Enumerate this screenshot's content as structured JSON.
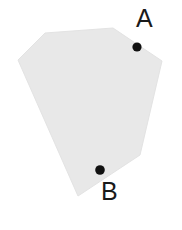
{
  "figure": {
    "type": "geometric-shape-diagram",
    "background_color": "#ffffff",
    "canvas": {
      "width": 182,
      "height": 230
    },
    "shape": {
      "name": "irregular-hexagon",
      "fill_color": "#e8e8e8",
      "stroke_color": "#e3e3e3",
      "vertices": [
        [
          45,
          33
        ],
        [
          113,
          28
        ],
        [
          162,
          61
        ],
        [
          140,
          155
        ],
        [
          78,
          196
        ],
        [
          18,
          60
        ]
      ],
      "points_path": "45,33 113,28 162,61 140,155 78,196 18,60"
    },
    "points": [
      {
        "id": "A",
        "label": "A",
        "marker_color": "#111111",
        "x": 137,
        "y": 47,
        "radius": 4.6,
        "label_position": "above-right",
        "inside_shape": true
      },
      {
        "id": "B",
        "label": "B",
        "marker_color": "#111111",
        "x": 100,
        "y": 170,
        "radius": 4.8,
        "label_position": "below-right",
        "inside_shape": true
      }
    ]
  }
}
